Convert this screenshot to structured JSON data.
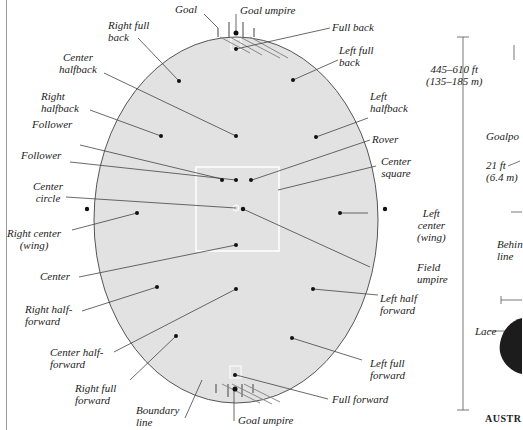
{
  "diagram": {
    "colors": {
      "field": "#e1e1e1",
      "outline": "#555555",
      "line": "#444444",
      "dot": "#111111",
      "square": "#ffffff",
      "ball": "#1a1a1a"
    },
    "labels": {
      "goal": "Goal",
      "goal_umpire_top": "Goal umpire",
      "full_back": "Full back",
      "right_full_back": "Right full\nback",
      "left_full_back": "Left full\nback",
      "center_halfback": "Center\nhalfback",
      "right_halfback": "Right\nhalfback",
      "left_halfback": "Left\nhalfback",
      "follower_1": "Follower",
      "follower_2": "Follower",
      "rover": "Rover",
      "center_square": "Center\nsquare",
      "center_circle": "Center\ncircle",
      "right_center_wing": "Right center\n(wing)",
      "left_center_wing": "Left\ncenter\n(wing)",
      "center": "Center",
      "field_umpire": "Field\numpire",
      "right_half_forward": "Right half-\nforward",
      "left_half_forward": "Left half\nforward",
      "center_half_forward": "Center half-\nforward",
      "right_full_forward": "Right full\nforward",
      "left_full_forward": "Left full\nforward",
      "boundary_line": "Boundary\nline",
      "full_forward": "Full forward",
      "goal_umpire_bottom": "Goal umpire"
    },
    "dimensions": {
      "field_length": "445–610 ft\n(135–185 m)"
    },
    "side_panel": {
      "goalposts": "Goalpo",
      "goal_width": "21 ft\n(6.4 m)",
      "behind_line": "Behin\nline",
      "lace": "Lace",
      "caption": "AUSTR"
    }
  }
}
